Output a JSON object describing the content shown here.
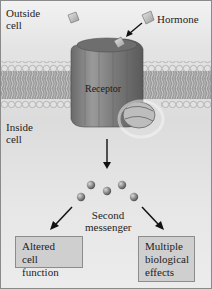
{
  "diagram": {
    "regions": {
      "outside": "Outside\ncell",
      "inside": "Inside\ncell"
    },
    "labels": {
      "hormone": "Hormone",
      "receptor": "Receptor",
      "second_messenger_line1": "Second",
      "second_messenger_line2": "messenger",
      "outside_line1": "Outside",
      "outside_line2": "cell",
      "inside_line1": "Inside",
      "inside_line2": "cell"
    },
    "outcomes": [
      {
        "lines": [
          "Altered",
          "cell function"
        ]
      },
      {
        "lines": [
          "Multiple",
          "biological",
          "effects"
        ]
      }
    ],
    "nodes": [
      "Hormone",
      "Receptor",
      "Second messenger",
      "Altered cell function",
      "Multiple biological effects"
    ],
    "edges": [
      {
        "from": "Hormone",
        "to": "Receptor"
      },
      {
        "from": "Receptor",
        "to": "Second messenger"
      },
      {
        "from": "Second messenger",
        "to": "Altered cell function"
      },
      {
        "from": "Second messenger",
        "to": "Multiple biological effects"
      }
    ],
    "colors": {
      "membrane_head": "#d8d8d8",
      "membrane_tail": "#8e8e8e",
      "receptor": "#7a7a7a",
      "box_fill": "#cfcfcf",
      "messenger": "#8a8a8a"
    }
  }
}
